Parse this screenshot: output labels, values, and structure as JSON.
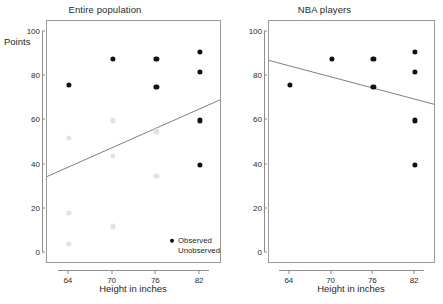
{
  "chart_data": {
    "type": "scatter",
    "title": "",
    "xlabel": "Height in inches",
    "ylabel": "Points",
    "xlim": [
      61,
      85
    ],
    "ylim": [
      -5,
      105
    ],
    "xticks": [
      64,
      70,
      76,
      82
    ],
    "yticks": [
      0,
      20,
      40,
      60,
      80,
      100
    ],
    "grid": false,
    "legend_position": "bottom-right-panel-1",
    "panels": [
      {
        "title": "Entire population",
        "series": [
          {
            "name": "Observed",
            "color": "#111111",
            "points": [
              {
                "x": 64,
                "y": 76
              },
              {
                "x": 70,
                "y": 88
              },
              {
                "x": 76,
                "y": 88
              },
              {
                "x": 76,
                "y": 75
              },
              {
                "x": 82,
                "y": 91
              },
              {
                "x": 82,
                "y": 82
              },
              {
                "x": 82,
                "y": 60
              },
              {
                "x": 82,
                "y": 40
              }
            ]
          },
          {
            "name": "Unobserved",
            "color": "#e2e2e2",
            "points": [
              {
                "x": 64,
                "y": 52
              },
              {
                "x": 64,
                "y": 18
              },
              {
                "x": 64,
                "y": 4
              },
              {
                "x": 70,
                "y": 60
              },
              {
                "x": 70,
                "y": 44
              },
              {
                "x": 70,
                "y": 12
              },
              {
                "x": 76,
                "y": 55
              },
              {
                "x": 76,
                "y": 35
              }
            ]
          }
        ],
        "regression_line": {
          "x_start": 61,
          "y_start": 34,
          "x_end": 85,
          "y_end": 69,
          "slope_sign": "positive"
        }
      },
      {
        "title": "NBA players",
        "series": [
          {
            "name": "Observed",
            "color": "#111111",
            "points": [
              {
                "x": 64,
                "y": 76
              },
              {
                "x": 70,
                "y": 88
              },
              {
                "x": 76,
                "y": 88
              },
              {
                "x": 76,
                "y": 75
              },
              {
                "x": 82,
                "y": 91
              },
              {
                "x": 82,
                "y": 82
              },
              {
                "x": 82,
                "y": 60
              },
              {
                "x": 82,
                "y": 40
              }
            ]
          }
        ],
        "regression_line": {
          "x_start": 61,
          "y_start": 87,
          "x_end": 85,
          "y_end": 67,
          "slope_sign": "negative"
        }
      }
    ],
    "legend": [
      {
        "label": "Observed",
        "marker": "filled-dot",
        "color": "#111111"
      },
      {
        "label": "Unobserved",
        "marker": "faint-dot",
        "color": "#e2e2e2"
      }
    ]
  },
  "panel_left": {
    "title": "Entire population",
    "xaxis_title": "Height in inches",
    "yaxis_title": "Points",
    "xticks": [
      "64",
      "70",
      "76",
      "82"
    ],
    "yticks": [
      "0",
      "20",
      "40",
      "60",
      "80",
      "100"
    ]
  },
  "panel_right": {
    "title": "NBA players",
    "xaxis_title": "Height in inches",
    "xticks": [
      "64",
      "70",
      "76",
      "82"
    ],
    "yticks": [
      "0",
      "20",
      "40",
      "60",
      "80",
      "100"
    ]
  },
  "legend": {
    "observed_label": "Observed",
    "unobserved_label": "Unobserved"
  }
}
